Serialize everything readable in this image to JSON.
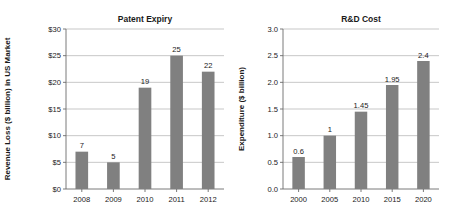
{
  "figure": {
    "background_color": "#ffffff",
    "bar_color": "#808080",
    "gridline_color": "#b9b9b9",
    "axis_color": "#6b6b6b"
  },
  "chart_data": [
    {
      "type": "bar",
      "title": "Patent Expiry",
      "xlabel": "",
      "ylabel": "Revenue Loss ($ billion) in US Market",
      "categories": [
        "2008",
        "2009",
        "2010",
        "2011",
        "2012"
      ],
      "values": [
        7,
        5,
        19,
        25,
        22
      ],
      "value_labels": [
        "7",
        "5",
        "19",
        "25",
        "22"
      ],
      "ylim": [
        0,
        30
      ],
      "ytick_values": [
        0,
        5,
        10,
        15,
        20,
        25,
        30
      ],
      "ytick_labels": [
        "$0",
        "$5",
        "$10",
        "$15",
        "$20",
        "$25",
        "$30"
      ],
      "grid": true,
      "legend": "none"
    },
    {
      "type": "bar",
      "title": "R&D Cost",
      "xlabel": "",
      "ylabel": "Expenditure ($ billion)",
      "categories": [
        "2000",
        "2005",
        "2010",
        "2015",
        "2020"
      ],
      "values": [
        0.6,
        1,
        1.45,
        1.95,
        2.4
      ],
      "value_labels": [
        "0.6",
        "1",
        "1.45",
        "1.95",
        "2.4"
      ],
      "ylim": [
        0,
        3
      ],
      "ytick_values": [
        0,
        0.5,
        1,
        1.5,
        2,
        2.5,
        3
      ],
      "ytick_labels": [
        "0.0",
        "0.5",
        "1.0",
        "1.5",
        "2.0",
        "2.5",
        "3.0"
      ],
      "grid": true,
      "legend": "none"
    }
  ]
}
